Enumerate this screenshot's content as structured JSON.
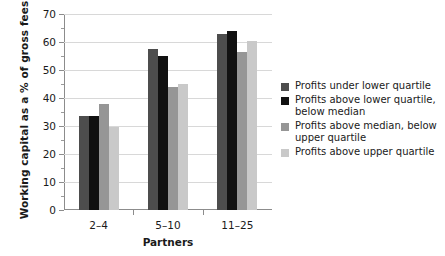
{
  "chart_data": {
    "type": "bar",
    "title": "",
    "xlabel": "Partners",
    "ylabel": "Working capital as a % of gross fees",
    "categories": [
      "2–4",
      "5–10",
      "11–25"
    ],
    "ylim": [
      0,
      70
    ],
    "ytick_labels": [
      "0",
      "10",
      "20",
      "30",
      "40",
      "50",
      "60",
      "70"
    ],
    "ytick_values": [
      0,
      10,
      20,
      30,
      40,
      50,
      60,
      70
    ],
    "yminor_values": [
      5,
      15,
      25,
      35,
      45,
      55,
      65
    ],
    "grid": true,
    "legend_position": "right",
    "series": [
      {
        "name": "Profits under lower quartile",
        "color": "#4d4d4d",
        "values": [
          33.5,
          57.5,
          63.0
        ]
      },
      {
        "name": "Profits above lower quartile, below median",
        "color": "#111111",
        "values": [
          33.5,
          55.0,
          64.0
        ]
      },
      {
        "name": "Profits above median, below upper quartile",
        "color": "#969696",
        "values": [
          38.0,
          44.0,
          56.5
        ]
      },
      {
        "name": "Profits above upper quartile",
        "color": "#c9c9c9",
        "values": [
          29.8,
          45.0,
          60.5
        ]
      }
    ]
  },
  "legend": {
    "entries": [
      {
        "label": "Profits under lower quartile",
        "color": "#4d4d4d"
      },
      {
        "label": "Profits above lower quartile, below median",
        "color": "#111111"
      },
      {
        "label": "Profits above median, below upper quartile",
        "color": "#969696"
      },
      {
        "label": "Profits above upper quartile",
        "color": "#c9c9c9"
      }
    ]
  },
  "axes": {
    "y_title": "Working capital as a % of gross fees",
    "x_title": "Partners"
  }
}
